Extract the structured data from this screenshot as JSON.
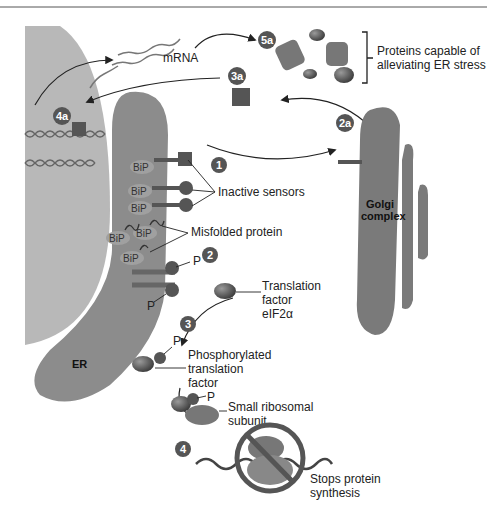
{
  "diagram": {
    "labels": {
      "mrna": "mRNA",
      "proteins_capable": "Proteins capable of",
      "alleviating": "alleviating ER stress",
      "inactive_sensors": "Inactive sensors",
      "misfolded_protein": "Misfolded protein",
      "golgi_line1": "Golgi",
      "golgi_line2": "complex",
      "er": "ER",
      "translation_l1": "Translation",
      "translation_l2": "factor",
      "translation_l3": "eIF2α",
      "phospho_l1": "Phosphorylated",
      "phospho_l2": "translation",
      "phospho_l3": "factor",
      "small_ribo_l1": "Small ribosomal",
      "small_ribo_l2": "subunit",
      "stops_l1": "Stops protein",
      "stops_l2": "synthesis",
      "p": "P",
      "bip": "BiP"
    },
    "steps": [
      "1",
      "2",
      "3",
      "4",
      "2a",
      "3a",
      "4a",
      "5a"
    ],
    "colors": {
      "nucleus": "#b4b4b4",
      "er": "#8a8a8a",
      "dark": "#5a5a5a",
      "badge": "#555555",
      "line": "#222222"
    }
  }
}
